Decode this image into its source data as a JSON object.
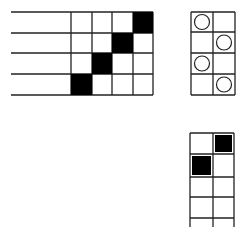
{
  "diagram": {
    "stroke_color": "#222222",
    "fill_color": "#000000",
    "background": "#ffffff",
    "left_grid": {
      "description": "4x4 grid with diagonal filled squares and extended row lines to the left",
      "rows": 4,
      "cols": 4,
      "filled_cells": [
        [
          0,
          3
        ],
        [
          1,
          2
        ],
        [
          2,
          1
        ],
        [
          3,
          0
        ]
      ]
    },
    "right_grid": {
      "description": "4x2 grid with circles alternating between columns",
      "rows": 4,
      "cols": 2,
      "circle_cells": [
        [
          0,
          0
        ],
        [
          1,
          1
        ],
        [
          2,
          0
        ],
        [
          3,
          1
        ]
      ]
    },
    "bottom_grid": {
      "description": "2-column grid open at bottom, two filled squares in top rows",
      "rows": 5,
      "cols": 2,
      "filled_cells": [
        [
          0,
          1
        ],
        [
          1,
          0
        ]
      ]
    }
  }
}
